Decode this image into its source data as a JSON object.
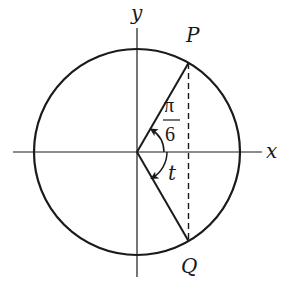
{
  "diagram": {
    "type": "unit-circle",
    "axes": {
      "x_label": "x",
      "y_label": "y"
    },
    "points": [
      {
        "name": "P",
        "label": "P",
        "angle_deg": 60
      },
      {
        "name": "Q",
        "label": "Q",
        "angle_deg": -60
      }
    ],
    "angles": {
      "upper": {
        "label_numerator": "π",
        "label_denominator": "6",
        "description": "angle from positive x-axis to OP, arrow counterclockwise"
      },
      "lower": {
        "label": "t",
        "description": "angle from positive x-axis to OQ, arrow clockwise"
      }
    },
    "segments": [
      {
        "from": "O",
        "to": "P",
        "style": "solid"
      },
      {
        "from": "O",
        "to": "Q",
        "style": "solid"
      },
      {
        "from": "P",
        "to": "Q",
        "style": "dashed"
      }
    ],
    "colors": {
      "stroke": "#1a1a1a",
      "background": "#ffffff"
    }
  }
}
